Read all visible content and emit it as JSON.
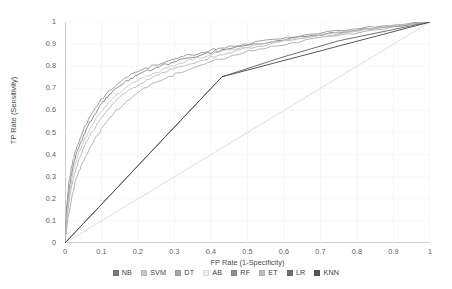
{
  "chart_data": {
    "type": "line",
    "title": "",
    "xlabel": "FP Rate (1-Specificity)",
    "ylabel": "TP Rate (Sensitivity)",
    "xlim": [
      0,
      1
    ],
    "ylim": [
      0,
      1
    ],
    "grid": true,
    "legend_position": "bottom",
    "xticks": [
      "0",
      "0.1",
      "0.2",
      "0.3",
      "0.4",
      "0.5",
      "0.6",
      "0.7",
      "0.8",
      "0.9",
      "1"
    ],
    "xtick_values": [
      0,
      0.1,
      0.2,
      0.3,
      0.4,
      0.5,
      0.6,
      0.7,
      0.8,
      0.9,
      1
    ],
    "yticks": [
      "0",
      "0.1",
      "0.2",
      "0.3",
      "0.4",
      "0.5",
      "0.6",
      "0.7",
      "0.8",
      "0.9",
      "1"
    ],
    "ytick_values": [
      0,
      0.1,
      0.2,
      0.3,
      0.4,
      0.5,
      0.6,
      0.7,
      0.8,
      0.9,
      1
    ],
    "series": [
      {
        "name": "NB",
        "color": "#7a7a7a",
        "x": [
          0,
          0.005,
          0.012,
          0.02,
          0.03,
          0.045,
          0.06,
          0.08,
          0.1,
          0.12,
          0.15,
          0.18,
          0.21,
          0.25,
          0.29,
          0.33,
          0.38,
          0.43,
          0.5,
          0.58,
          0.68,
          0.8,
          0.9,
          1
        ],
        "y": [
          0,
          0.14,
          0.25,
          0.33,
          0.4,
          0.46,
          0.52,
          0.58,
          0.63,
          0.67,
          0.71,
          0.745,
          0.77,
          0.795,
          0.815,
          0.835,
          0.855,
          0.875,
          0.895,
          0.915,
          0.94,
          0.962,
          0.98,
          1
        ]
      },
      {
        "name": "SVM",
        "color": "#b4b4b4",
        "x": [
          0,
          0.006,
          0.014,
          0.025,
          0.04,
          0.055,
          0.075,
          0.095,
          0.115,
          0.14,
          0.17,
          0.2,
          0.24,
          0.28,
          0.32,
          0.37,
          0.42,
          0.48,
          0.56,
          0.66,
          0.78,
          0.89,
          1
        ],
        "y": [
          0,
          0.12,
          0.22,
          0.31,
          0.385,
          0.445,
          0.505,
          0.555,
          0.6,
          0.645,
          0.685,
          0.715,
          0.75,
          0.775,
          0.8,
          0.825,
          0.85,
          0.875,
          0.9,
          0.928,
          0.955,
          0.978,
          1
        ]
      },
      {
        "name": "DT",
        "color": "#a8a8a8",
        "x": [
          0,
          0.008,
          0.018,
          0.03,
          0.048,
          0.068,
          0.09,
          0.112,
          0.135,
          0.165,
          0.195,
          0.23,
          0.27,
          0.31,
          0.355,
          0.4,
          0.46,
          0.53,
          0.62,
          0.72,
          0.84,
          1
        ],
        "y": [
          0,
          0.11,
          0.2,
          0.29,
          0.365,
          0.43,
          0.49,
          0.545,
          0.59,
          0.635,
          0.675,
          0.71,
          0.74,
          0.77,
          0.795,
          0.82,
          0.85,
          0.877,
          0.906,
          0.935,
          0.963,
          1
        ]
      },
      {
        "name": "AB",
        "color": "#e4e4e4",
        "x": [
          0,
          0.04,
          0.1,
          0.2,
          0.3,
          0.4,
          0.5,
          0.6,
          0.7,
          0.8,
          0.9,
          1
        ],
        "y": [
          0,
          0.04,
          0.1,
          0.2,
          0.3,
          0.4,
          0.5,
          0.6,
          0.7,
          0.8,
          0.9,
          1
        ]
      },
      {
        "name": "RF",
        "color": "#8e8e8e",
        "x": [
          0,
          0.004,
          0.01,
          0.018,
          0.028,
          0.042,
          0.057,
          0.075,
          0.095,
          0.115,
          0.145,
          0.175,
          0.205,
          0.245,
          0.285,
          0.325,
          0.375,
          0.425,
          0.49,
          0.57,
          0.67,
          0.79,
          0.89,
          1
        ],
        "y": [
          0,
          0.155,
          0.265,
          0.345,
          0.415,
          0.475,
          0.535,
          0.59,
          0.64,
          0.68,
          0.72,
          0.755,
          0.78,
          0.805,
          0.825,
          0.845,
          0.862,
          0.882,
          0.9,
          0.922,
          0.945,
          0.968,
          0.984,
          1
        ]
      },
      {
        "name": "ET",
        "color": "#c2c2c2",
        "x": [
          0,
          0.005,
          0.013,
          0.022,
          0.035,
          0.05,
          0.068,
          0.088,
          0.108,
          0.132,
          0.16,
          0.19,
          0.225,
          0.265,
          0.305,
          0.35,
          0.4,
          0.455,
          0.53,
          0.62,
          0.73,
          0.86,
          1
        ],
        "y": [
          0,
          0.13,
          0.235,
          0.32,
          0.395,
          0.455,
          0.515,
          0.57,
          0.615,
          0.655,
          0.695,
          0.728,
          0.757,
          0.782,
          0.806,
          0.83,
          0.852,
          0.874,
          0.898,
          0.922,
          0.948,
          0.974,
          1
        ]
      },
      {
        "name": "LR",
        "color": "#6f6f6f",
        "x": [
          0,
          0.1,
          0.2,
          0.3,
          0.43,
          0.6,
          0.75,
          1
        ],
        "y": [
          0,
          0.175,
          0.35,
          0.525,
          0.752,
          0.843,
          0.915,
          1
        ]
      },
      {
        "name": "KNN",
        "color": "#585858",
        "x": [
          0,
          0.43,
          1
        ],
        "y": [
          0,
          0.752,
          1
        ]
      }
    ],
    "reference_line": {
      "name": "chance",
      "color": "#e0e0e0",
      "x": [
        0,
        1
      ],
      "y": [
        0,
        1
      ]
    }
  },
  "legend": {
    "items": [
      {
        "label": "NB",
        "color": "#7a7a7a"
      },
      {
        "label": "SVM",
        "color": "#c9c9c9"
      },
      {
        "label": "DT",
        "color": "#a8a8a8"
      },
      {
        "label": "AB",
        "color": "#ededed"
      },
      {
        "label": "RF",
        "color": "#8e8e8e"
      },
      {
        "label": "ET",
        "color": "#bdbdbd"
      },
      {
        "label": "LR",
        "color": "#6f6f6f"
      },
      {
        "label": "KNN",
        "color": "#585858"
      }
    ]
  }
}
